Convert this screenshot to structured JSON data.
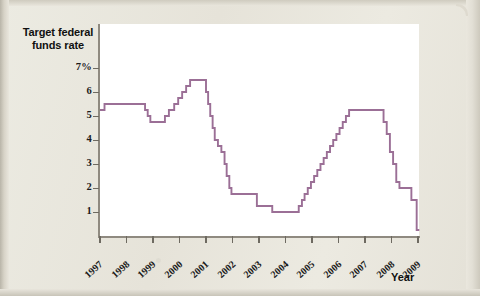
{
  "figure": {
    "y_axis_title": "Target federal funds rate",
    "x_axis_title": "Year",
    "line_color": "#9b6f96",
    "plot_background": "#ffffff",
    "page_background": "#e8e5dc"
  },
  "chart_data": {
    "type": "line",
    "title": "Target federal funds rate",
    "xlabel": "Year",
    "ylabel": "Target federal funds rate",
    "ylim": [
      0,
      7.4
    ],
    "xlim": [
      1997,
      2009.2
    ],
    "grid": false,
    "legend": null,
    "step": "post",
    "ytick_labels": [
      "7%",
      "6",
      "5",
      "4",
      "3",
      "2",
      "1"
    ],
    "ytick_values": [
      7,
      6,
      5,
      4,
      3,
      2,
      1
    ],
    "xtick_labels": [
      "1997",
      "1998",
      "1999",
      "2000",
      "2001",
      "2002",
      "2003",
      "2004",
      "2005",
      "2006",
      "2007",
      "2008",
      "2009"
    ],
    "xtick_values": [
      1997,
      1998,
      1999,
      2000,
      2001,
      2002,
      2003,
      2004,
      2005,
      2006,
      2007,
      2008,
      2009
    ],
    "series": [
      {
        "name": "Target federal funds rate",
        "color": "#9b6f96",
        "x": [
          1997.0,
          1997.17,
          1998.7,
          1998.8,
          1998.9,
          1999.45,
          1999.6,
          1999.8,
          1999.95,
          2000.1,
          2000.25,
          2000.4,
          2001.0,
          2001.08,
          2001.16,
          2001.25,
          2001.33,
          2001.45,
          2001.58,
          2001.7,
          2001.78,
          2001.88,
          2001.96,
          2002.92,
          2003.5,
          2004.5,
          2004.62,
          2004.72,
          2004.84,
          2004.96,
          2005.08,
          2005.2,
          2005.32,
          2005.44,
          2005.56,
          2005.68,
          2005.8,
          2005.92,
          2006.04,
          2006.16,
          2006.28,
          2006.4,
          2006.52,
          2007.7,
          2007.82,
          2007.94,
          2008.06,
          2008.18,
          2008.3,
          2008.75,
          2008.95,
          2009.0
        ],
        "y": [
          5.25,
          5.5,
          5.25,
          5.0,
          4.75,
          5.0,
          5.25,
          5.5,
          5.75,
          6.0,
          6.25,
          6.5,
          6.0,
          5.5,
          5.0,
          4.5,
          4.0,
          3.75,
          3.5,
          3.0,
          2.5,
          2.0,
          1.75,
          1.25,
          1.0,
          1.25,
          1.5,
          1.75,
          2.0,
          2.25,
          2.5,
          2.75,
          3.0,
          3.25,
          3.5,
          3.75,
          4.0,
          4.25,
          4.5,
          4.75,
          5.0,
          5.25,
          5.25,
          4.75,
          4.25,
          3.5,
          3.0,
          2.25,
          2.0,
          1.5,
          0.25,
          0.25
        ],
        "notes": "Stepped (staircase) FOMC target rate path, 1997-2009"
      }
    ]
  }
}
